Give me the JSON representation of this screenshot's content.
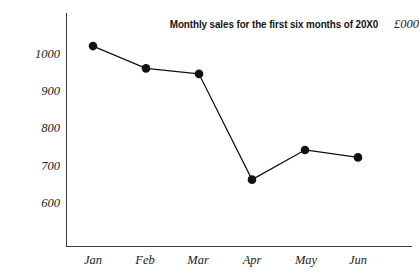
{
  "chart_data": {
    "type": "line",
    "title": "Monthly sales for the first six months of 20X0",
    "xlabel": "",
    "ylabel": "£000",
    "categories": [
      "Jan",
      "Feb",
      "Mar",
      "Apr",
      "May",
      "Jun"
    ],
    "values": [
      1020,
      960,
      945,
      660,
      740,
      720
    ],
    "series": [
      {
        "name": "Monthly sales",
        "values": [
          1020,
          960,
          945,
          660,
          740,
          720
        ]
      }
    ],
    "ytick_labels": [
      "1000",
      "900",
      "800",
      "700",
      "600"
    ],
    "ytick_values": [
      1000,
      900,
      800,
      700,
      600
    ],
    "ylim": [
      560,
      1060
    ],
    "xlim_categories": [
      "Jan",
      "Jun"
    ],
    "grid": false,
    "legend": false,
    "legend_position": "none",
    "marker": "filled-circle",
    "line_color": "#111111",
    "marker_color": "#111111",
    "axis_color": "#3a3a3a",
    "background_color": "#ffffff",
    "unit_label": "£000",
    "annotations": []
  }
}
